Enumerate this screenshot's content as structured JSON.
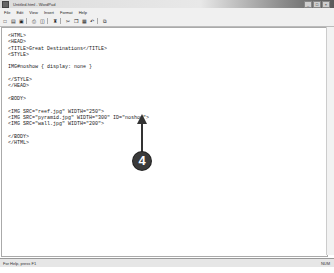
{
  "window": {
    "title": "Untitled.html - WordPad",
    "controls": [
      "_",
      "□",
      "×"
    ]
  },
  "menubar": {
    "items": [
      "File",
      "Edit",
      "View",
      "Insert",
      "Format",
      "Help"
    ]
  },
  "toolbar": {
    "buttons": [
      {
        "name": "new-icon",
        "glyph": "□"
      },
      {
        "name": "open-icon",
        "glyph": "▤"
      },
      {
        "name": "save-icon",
        "glyph": "▣"
      },
      {
        "name": "print-icon",
        "glyph": "⎙"
      },
      {
        "name": "print-preview-icon",
        "glyph": "◫"
      },
      {
        "name": "find-icon",
        "glyph": "♜"
      },
      {
        "name": "cut-icon",
        "glyph": "✂"
      },
      {
        "name": "copy-icon",
        "glyph": "❐"
      },
      {
        "name": "paste-icon",
        "glyph": "▦"
      },
      {
        "name": "undo-icon",
        "glyph": "↶"
      },
      {
        "name": "insert-datetime-icon",
        "glyph": "⧉"
      }
    ]
  },
  "document": {
    "lines": [
      "<HTML>",
      "<HEAD>",
      "<TITLE>Great Destinations</TITLE>",
      "<STYLE>",
      "",
      "IMG#noshow { display: none }",
      "",
      "</STYLE>",
      "</HEAD>",
      "",
      "<BODY>",
      "",
      "<IMG SRC=\"reef.jpg\" WIDTH=\"250\">",
      "<IMG SRC=\"pyramid.jpg\" WIDTH=\"300\" ID=\"noshow\">",
      "<IMG SRC=\"wall.jpg\" WIDTH=\"200\">",
      "",
      "</BODY>",
      "</HTML>"
    ]
  },
  "callout": {
    "number": "4"
  },
  "statusbar": {
    "left": "For Help, press F1",
    "right": "NUM"
  }
}
